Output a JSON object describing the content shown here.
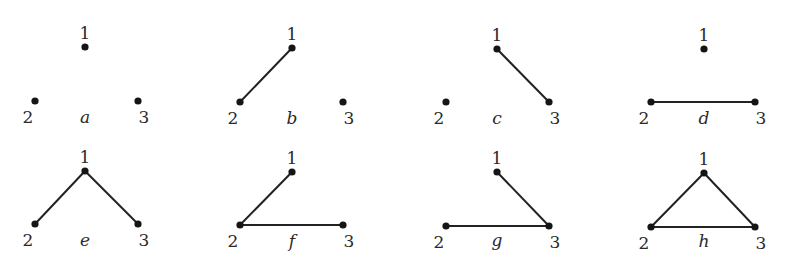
{
  "diagram": {
    "title": "",
    "colors": {
      "edge": "#222222",
      "node": "#151515",
      "text": "#2a2a2a",
      "background": "#ffffff"
    },
    "graphs": [
      {
        "id": "a",
        "label": "a",
        "label_pos": [
          85,
          123
        ],
        "nodes": [
          {
            "id": "1",
            "label": "1",
            "x": 85,
            "y": 47
          },
          {
            "id": "2",
            "label": "2",
            "x": 35,
            "y": 101
          },
          {
            "id": "3",
            "label": "3",
            "x": 138,
            "y": 101
          }
        ],
        "edges": []
      },
      {
        "id": "b",
        "label": "b",
        "label_pos": [
          292,
          124
        ],
        "nodes": [
          {
            "id": "1",
            "label": "1",
            "x": 292,
            "y": 48
          },
          {
            "id": "2",
            "label": "2",
            "x": 240,
            "y": 102
          },
          {
            "id": "3",
            "label": "3",
            "x": 343,
            "y": 102
          }
        ],
        "edges": [
          [
            "1",
            "2"
          ]
        ]
      },
      {
        "id": "c",
        "label": "c",
        "label_pos": [
          497,
          124
        ],
        "nodes": [
          {
            "id": "1",
            "label": "1",
            "x": 497,
            "y": 49
          },
          {
            "id": "2",
            "label": "2",
            "x": 446,
            "y": 102
          },
          {
            "id": "3",
            "label": "3",
            "x": 549,
            "y": 102
          }
        ],
        "edges": [
          [
            "1",
            "3"
          ]
        ]
      },
      {
        "id": "d",
        "label": "d",
        "label_pos": [
          704,
          124
        ],
        "nodes": [
          {
            "id": "1",
            "label": "1",
            "x": 704,
            "y": 49
          },
          {
            "id": "2",
            "label": "2",
            "x": 651,
            "y": 102
          },
          {
            "id": "3",
            "label": "3",
            "x": 755,
            "y": 102
          }
        ],
        "edges": [
          [
            "2",
            "3"
          ]
        ]
      },
      {
        "id": "e",
        "label": "e",
        "label_pos": [
          85,
          246
        ],
        "nodes": [
          {
            "id": "1",
            "label": "1",
            "x": 85,
            "y": 171
          },
          {
            "id": "2",
            "label": "2",
            "x": 35,
            "y": 224
          },
          {
            "id": "3",
            "label": "3",
            "x": 138,
            "y": 224
          }
        ],
        "edges": [
          [
            "1",
            "2"
          ],
          [
            "1",
            "3"
          ]
        ]
      },
      {
        "id": "f",
        "label": "f",
        "label_pos": [
          292,
          247
        ],
        "nodes": [
          {
            "id": "1",
            "label": "1",
            "x": 292,
            "y": 172
          },
          {
            "id": "2",
            "label": "2",
            "x": 240,
            "y": 225
          },
          {
            "id": "3",
            "label": "3",
            "x": 343,
            "y": 225
          }
        ],
        "edges": [
          [
            "1",
            "2"
          ],
          [
            "2",
            "3"
          ]
        ]
      },
      {
        "id": "g",
        "label": "g",
        "label_pos": [
          497,
          246
        ],
        "nodes": [
          {
            "id": "1",
            "label": "1",
            "x": 497,
            "y": 172
          },
          {
            "id": "2",
            "label": "2",
            "x": 446,
            "y": 226
          },
          {
            "id": "3",
            "label": "3",
            "x": 549,
            "y": 226
          }
        ],
        "edges": [
          [
            "1",
            "3"
          ],
          [
            "2",
            "3"
          ]
        ]
      },
      {
        "id": "h",
        "label": "h",
        "label_pos": [
          704,
          247
        ],
        "nodes": [
          {
            "id": "1",
            "label": "1",
            "x": 704,
            "y": 173
          },
          {
            "id": "2",
            "label": "2",
            "x": 651,
            "y": 227
          },
          {
            "id": "3",
            "label": "3",
            "x": 755,
            "y": 227
          }
        ],
        "edges": [
          [
            "1",
            "2"
          ],
          [
            "1",
            "3"
          ],
          [
            "2",
            "3"
          ]
        ]
      }
    ]
  }
}
